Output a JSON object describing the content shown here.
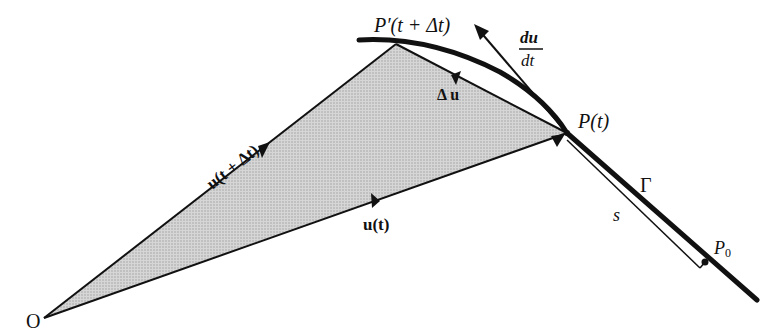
{
  "diagram": {
    "type": "vector-calculus-curve",
    "colors": {
      "ink": "#111111",
      "shade": "#c8c8c8",
      "background": "#ffffff"
    },
    "points": {
      "origin": {
        "label": "O",
        "x": 44,
        "y": 318
      },
      "p_prime": {
        "label": "P′(t + Δt)",
        "x": 396,
        "y": 44
      },
      "p": {
        "label": "P(t)",
        "x": 567,
        "y": 133
      },
      "p0": {
        "label": "P₀",
        "x": 705,
        "y": 262
      }
    },
    "labels": {
      "origin": "O",
      "p_prime_main": "P′(t + Δt)",
      "p_main": "P(t)",
      "p0_main": "P",
      "p0_sub": "0",
      "du_dt_num": "du",
      "du_dt_den": "dt",
      "delta_u": "Δ u",
      "u_t_plus": "u(t + Δt)",
      "u_t": "u(t)",
      "gamma": "Γ",
      "s": "s"
    },
    "vectors": [
      {
        "name": "u(t + Δt)",
        "from": "O",
        "to": "P′"
      },
      {
        "name": "u(t)",
        "from": "O",
        "to": "P"
      },
      {
        "name": "Δu",
        "from": "P",
        "to": "P′"
      },
      {
        "name": "du/dt",
        "from": "P",
        "direction": "tangent"
      }
    ]
  }
}
